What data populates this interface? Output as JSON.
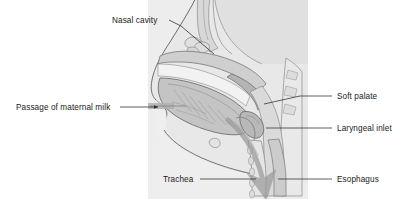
{
  "figure": {
    "kind": "anatomical-sagittal-section",
    "background_color": "#ffffff",
    "panel_color": "#ededed",
    "outline_color": "#6f6f6f",
    "tissue_light": "#e4e4e4",
    "tissue_mid": "#c9c9c9",
    "tissue_dark": "#a8a8a8",
    "bone_color": "#efefef",
    "flow_arrow_color": "#9a9a9a",
    "label_color": "#1a1a1a",
    "leader_color": "#2b2b2b"
  },
  "labels": [
    {
      "id": "nasal-cavity",
      "text": "Nasal cavity",
      "text_x": 112,
      "text_y": 23,
      "anchor": "start",
      "leader": "M 169 20 L 181 26 L 214 54",
      "has_arrow": false
    },
    {
      "id": "passage-of-maternal-milk",
      "text": "Passage of maternal milk",
      "text_x": 16,
      "text_y": 110,
      "anchor": "start",
      "leader": "M 120 107 L 160 107",
      "has_arrow": true
    },
    {
      "id": "soft-palate",
      "text": "Soft palate",
      "text_x": 337,
      "text_y": 99,
      "anchor": "start",
      "leader": "M 332 96 L 296 96 L 262 104",
      "has_arrow": false
    },
    {
      "id": "laryngeal-inlet",
      "text": "Laryngeal inlet",
      "text_x": 337,
      "text_y": 131,
      "anchor": "start",
      "leader": "M 332 128 L 296 128 L 268 128",
      "has_arrow": false
    },
    {
      "id": "trachea",
      "text": "Trachea",
      "text_x": 163,
      "text_y": 182,
      "anchor": "start",
      "leader": "M 200 179 L 262 179",
      "has_arrow": false
    },
    {
      "id": "esophagus",
      "text": "Esophagus",
      "text_x": 337,
      "text_y": 182,
      "anchor": "start",
      "leader": "M 332 179 L 296 179 L 280 179",
      "has_arrow": false
    }
  ]
}
